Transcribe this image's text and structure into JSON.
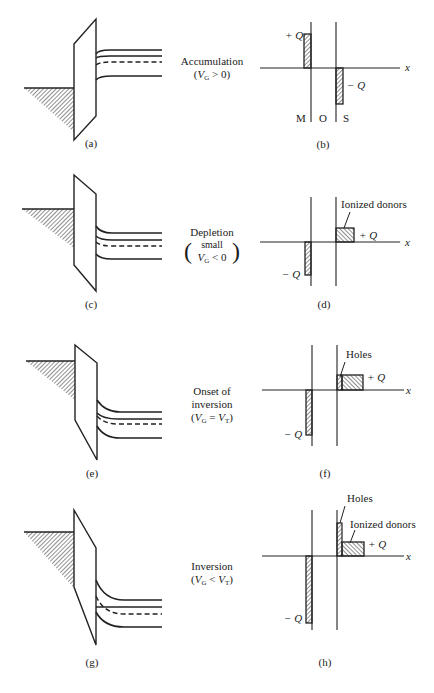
{
  "figure": {
    "panels": [
      {
        "id": "a",
        "caption": "(a)"
      },
      {
        "id": "b",
        "caption": "(b)"
      },
      {
        "id": "c",
        "caption": "(c)"
      },
      {
        "id": "d",
        "caption": "(d)"
      },
      {
        "id": "e",
        "caption": "(e)"
      },
      {
        "id": "f",
        "caption": "(f)"
      },
      {
        "id": "g",
        "caption": "(g)"
      },
      {
        "id": "h",
        "caption": "(h)"
      }
    ],
    "states": [
      {
        "name": "Accumulation",
        "condition_prefix": "(",
        "var": "V",
        "sub": "G",
        "condition_rest": " > 0)"
      },
      {
        "name": "Depletion",
        "small": "small",
        "var": "V",
        "sub": "G",
        "condition_rest": " < 0"
      },
      {
        "name_line1": "Onset of",
        "name_line2": "inversion",
        "var": "V",
        "sub": "G",
        "eq": " = ",
        "var2": "V",
        "sub2": "T"
      },
      {
        "name": "Inversion",
        "var": "V",
        "sub": "G",
        "lt": " < ",
        "var2": "V",
        "sub2": "T"
      }
    ],
    "charge_labels": {
      "plus_q": "+ Q",
      "minus_q": "− Q",
      "x_axis": "x",
      "metal": "M",
      "oxide": "O",
      "semiconductor": "S",
      "ionized_donors": "Ionized donors",
      "holes": "Holes"
    }
  }
}
